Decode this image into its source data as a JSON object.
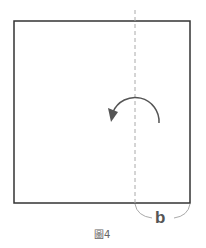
{
  "figure": {
    "label_b": "b",
    "caption": "圖4",
    "colors": {
      "square_stroke": "#333333",
      "fold_line": "#aaaaaa",
      "arrow": "#555555",
      "brace": "#aaaaaa"
    }
  }
}
